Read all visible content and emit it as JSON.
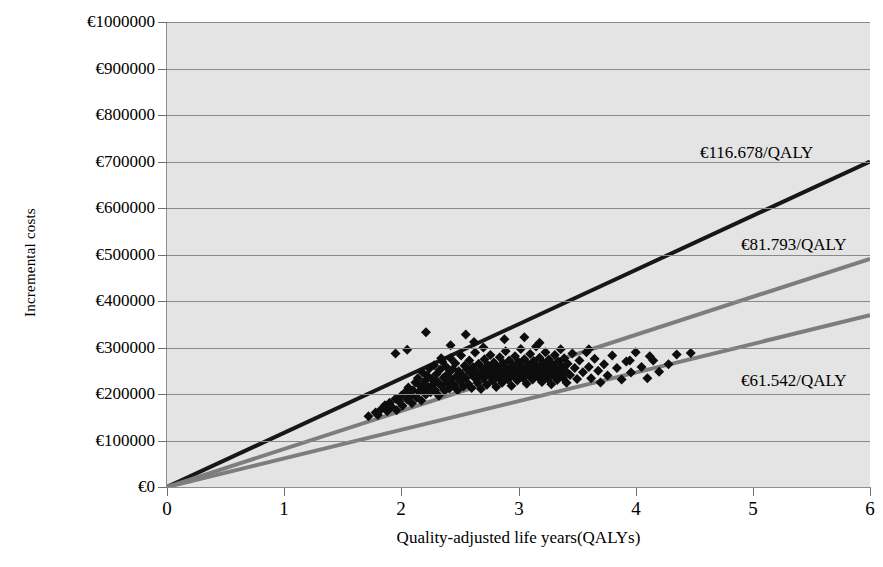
{
  "chart_data": {
    "type": "scatter",
    "title": "",
    "subtitle": "",
    "xlabel": "Quality-adjusted life years(QALYs)",
    "ylabel": "Incremental costs",
    "xlim": [
      0,
      6
    ],
    "ylim": [
      0,
      1000000
    ],
    "grid": true,
    "grid_axis": "y",
    "legend": "none",
    "plot_background": "#e4e4e4",
    "xticks": [
      0,
      1,
      2,
      3,
      4,
      5,
      6
    ],
    "xticklabels": [
      "0",
      "1",
      "2",
      "3",
      "4",
      "5",
      "6"
    ],
    "yticks": [
      0,
      100000,
      200000,
      300000,
      400000,
      500000,
      600000,
      700000,
      800000,
      900000,
      1000000
    ],
    "yticklabels": [
      "€0",
      "€100000",
      "€200000",
      "€300000",
      "€400000",
      "€500000",
      "€600000",
      "€700000",
      "€800000",
      "€900000",
      "€1000000"
    ],
    "reference_lines": [
      {
        "name": "icer-ceiling-116678",
        "label": "€116.678/QALY",
        "slope": 116678,
        "intercept": 0,
        "color": "#171717",
        "width": 4,
        "label_x": 4.55,
        "label_y": 718000
      },
      {
        "name": "icer-ceiling-81793",
        "label": "€81.793/QALY",
        "slope": 81793,
        "intercept": 0,
        "color": "#7d7d7d",
        "width": 4,
        "label_x": 4.9,
        "label_y": 521000
      },
      {
        "name": "icer-ceiling-61542",
        "label": "€61.542/QALY",
        "slope": 61542,
        "intercept": 0,
        "color": "#7d7d7d",
        "width": 4,
        "label_x": 4.9,
        "label_y": 228000
      }
    ],
    "series": [
      {
        "name": "bootstrap-replicates",
        "marker": "diamond",
        "color": "#0d0d0d",
        "marker_size": 5,
        "n_points": 520,
        "x_range": [
          1.7,
          4.47
        ],
        "y_range": [
          143000,
          333000
        ],
        "points": [
          [
            1.72,
            152000
          ],
          [
            1.78,
            160000
          ],
          [
            1.8,
            155000
          ],
          [
            1.83,
            168000
          ],
          [
            1.86,
            176000
          ],
          [
            1.88,
            163000
          ],
          [
            1.9,
            181000
          ],
          [
            1.92,
            172000
          ],
          [
            1.95,
            190000
          ],
          [
            1.96,
            165000
          ],
          [
            1.98,
            184000
          ],
          [
            2.0,
            196000
          ],
          [
            2.01,
            175000
          ],
          [
            2.03,
            203000
          ],
          [
            2.05,
            188000
          ],
          [
            2.06,
            214000
          ],
          [
            2.08,
            197000
          ],
          [
            2.09,
            180000
          ],
          [
            2.1,
            208000
          ],
          [
            2.12,
            225000
          ],
          [
            2.13,
            192000
          ],
          [
            2.14,
            234000
          ],
          [
            2.15,
            205000
          ],
          [
            2.16,
            218000
          ],
          [
            2.17,
            186000
          ],
          [
            2.18,
            246000
          ],
          [
            2.19,
            210000
          ],
          [
            2.2,
            228000
          ],
          [
            2.21,
            199000
          ],
          [
            2.22,
            240000
          ],
          [
            2.23,
            215000
          ],
          [
            2.24,
            255000
          ],
          [
            2.25,
            204000
          ],
          [
            2.26,
            232000
          ],
          [
            2.27,
            221000
          ],
          [
            2.28,
            262000
          ],
          [
            2.29,
            208000
          ],
          [
            2.3,
            243000
          ],
          [
            2.31,
            226000
          ],
          [
            2.32,
            196000
          ],
          [
            2.33,
            252000
          ],
          [
            2.34,
            218000
          ],
          [
            2.35,
            270000
          ],
          [
            2.36,
            235000
          ],
          [
            2.37,
            207000
          ],
          [
            2.38,
            259000
          ],
          [
            2.39,
            224000
          ],
          [
            2.4,
            244000
          ],
          [
            2.41,
            212000
          ],
          [
            2.42,
            277000
          ],
          [
            2.43,
            231000
          ],
          [
            2.44,
            254000
          ],
          [
            2.45,
            219000
          ],
          [
            2.46,
            266000
          ],
          [
            2.47,
            238000
          ],
          [
            2.48,
            208000
          ],
          [
            2.49,
            249000
          ],
          [
            2.5,
            227000
          ],
          [
            2.51,
            283000
          ],
          [
            2.52,
            241000
          ],
          [
            2.53,
            216000
          ],
          [
            2.54,
            261000
          ],
          [
            2.55,
            234000
          ],
          [
            2.56,
            253000
          ],
          [
            2.57,
            222000
          ],
          [
            2.58,
            272000
          ],
          [
            2.59,
            245000
          ],
          [
            2.6,
            213000
          ],
          [
            2.61,
            258000
          ],
          [
            2.62,
            236000
          ],
          [
            2.63,
            289000
          ],
          [
            2.64,
            248000
          ],
          [
            2.65,
            224000
          ],
          [
            2.66,
            265000
          ],
          [
            2.67,
            240000
          ],
          [
            2.68,
            211000
          ],
          [
            2.69,
            256000
          ],
          [
            2.7,
            233000
          ],
          [
            2.71,
            275000
          ],
          [
            2.72,
            247000
          ],
          [
            2.73,
            220000
          ],
          [
            2.74,
            262000
          ],
          [
            2.75,
            239000
          ],
          [
            2.76,
            284000
          ],
          [
            2.77,
            252000
          ],
          [
            2.78,
            228000
          ],
          [
            2.79,
            268000
          ],
          [
            2.8,
            243000
          ],
          [
            2.81,
            215000
          ],
          [
            2.82,
            259000
          ],
          [
            2.83,
            236000
          ],
          [
            2.84,
            279000
          ],
          [
            2.85,
            250000
          ],
          [
            2.86,
            224000
          ],
          [
            2.87,
            266000
          ],
          [
            2.88,
            241000
          ],
          [
            2.89,
            292000
          ],
          [
            2.9,
            255000
          ],
          [
            2.91,
            231000
          ],
          [
            2.92,
            272000
          ],
          [
            2.93,
            246000
          ],
          [
            2.94,
            218000
          ],
          [
            2.95,
            262000
          ],
          [
            2.96,
            238000
          ],
          [
            2.97,
            281000
          ],
          [
            2.98,
            253000
          ],
          [
            2.99,
            229000
          ],
          [
            3.0,
            269000
          ],
          [
            3.01,
            244000
          ],
          [
            3.02,
            297000
          ],
          [
            3.03,
            258000
          ],
          [
            3.04,
            234000
          ],
          [
            3.05,
            275000
          ],
          [
            3.06,
            249000
          ],
          [
            3.07,
            222000
          ],
          [
            3.08,
            264000
          ],
          [
            3.09,
            240000
          ],
          [
            3.1,
            286000
          ],
          [
            3.11,
            256000
          ],
          [
            3.12,
            231000
          ],
          [
            3.13,
            271000
          ],
          [
            3.14,
            246000
          ],
          [
            3.15,
            302000
          ],
          [
            3.16,
            260000
          ],
          [
            3.17,
            236000
          ],
          [
            3.18,
            278000
          ],
          [
            3.19,
            251000
          ],
          [
            3.2,
            226000
          ],
          [
            3.21,
            267000
          ],
          [
            3.22,
            242000
          ],
          [
            3.23,
            290000
          ],
          [
            3.24,
            258000
          ],
          [
            3.25,
            233000
          ],
          [
            3.26,
            274000
          ],
          [
            3.27,
            248000
          ],
          [
            3.28,
            221000
          ],
          [
            3.29,
            263000
          ],
          [
            3.3,
            239000
          ],
          [
            3.31,
            284000
          ],
          [
            3.32,
            254000
          ],
          [
            3.33,
            230000
          ],
          [
            3.34,
            270000
          ],
          [
            3.35,
            245000
          ],
          [
            3.36,
            296000
          ],
          [
            3.37,
            259000
          ],
          [
            3.38,
            235000
          ],
          [
            3.39,
            277000
          ],
          [
            3.4,
            250000
          ],
          [
            3.41,
            224000
          ],
          [
            3.42,
            265000
          ],
          [
            3.44,
            241000
          ],
          [
            3.46,
            287000
          ],
          [
            3.48,
            256000
          ],
          [
            3.5,
            232000
          ],
          [
            3.52,
            272000
          ],
          [
            3.55,
            247000
          ],
          [
            3.58,
            290000
          ],
          [
            3.6,
            258000
          ],
          [
            3.62,
            234000
          ],
          [
            3.65,
            276000
          ],
          [
            3.68,
            250000
          ],
          [
            3.7,
            225000
          ],
          [
            3.73,
            264000
          ],
          [
            3.76,
            240000
          ],
          [
            3.8,
            283000
          ],
          [
            3.84,
            256000
          ],
          [
            3.88,
            231000
          ],
          [
            3.92,
            270000
          ],
          [
            3.96,
            246000
          ],
          [
            4.0,
            290000
          ],
          [
            4.05,
            258000
          ],
          [
            4.1,
            234000
          ],
          [
            4.15,
            272000
          ],
          [
            4.2,
            248000
          ],
          [
            4.28,
            264000
          ],
          [
            4.35,
            285000
          ],
          [
            4.47,
            288000
          ],
          [
            2.21,
            333000
          ],
          [
            2.55,
            328000
          ],
          [
            2.7,
            300000
          ],
          [
            2.05,
            295000
          ],
          [
            2.88,
            318000
          ],
          [
            3.05,
            322000
          ],
          [
            3.18,
            310000
          ],
          [
            2.42,
            305000
          ],
          [
            1.95,
            287000
          ],
          [
            3.6,
            296000
          ],
          [
            3.95,
            272000
          ],
          [
            4.12,
            281000
          ],
          [
            2.34,
            277000
          ],
          [
            2.62,
            312000
          ]
        ]
      }
    ],
    "note": "Cost-effectiveness plane scatter of bootstrap replicates with three ICER threshold rays through the origin."
  },
  "axis": {
    "ylabel": "Incremental costs",
    "xlabel": "Quality-adjusted life years(QALYs)"
  }
}
